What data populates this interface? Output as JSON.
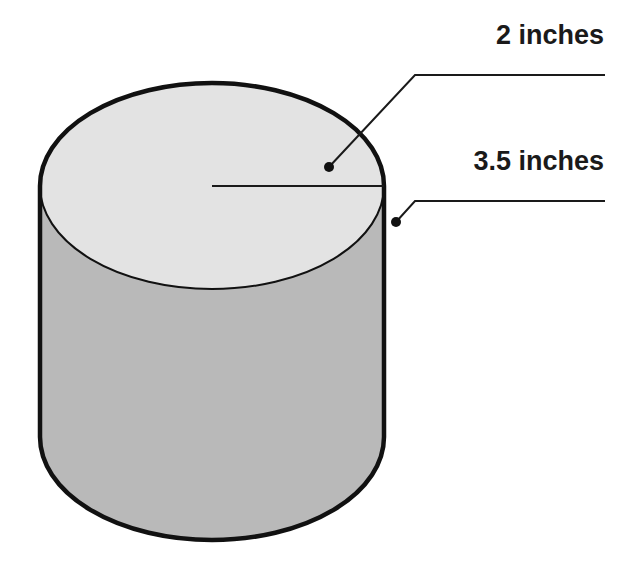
{
  "diagram": {
    "type": "cylinder",
    "labels": {
      "top": "2 inches",
      "side": "3.5 inches"
    },
    "colors": {
      "top_face": "#e3e3e3",
      "side_face": "#b9b9b9",
      "outline": "#111111",
      "leader": "#1a1a1a"
    }
  }
}
